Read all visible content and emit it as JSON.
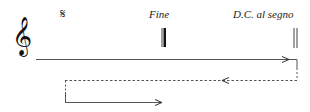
{
  "diagram": {
    "clef": {
      "name": "treble-clef",
      "glyph": "𝄞"
    },
    "segno": {
      "name": "segno",
      "glyph": "𝄋"
    },
    "labels": {
      "fine": "Fine",
      "dc_al_segno": "D.C. al segno"
    },
    "barlines": [
      {
        "name": "final-barline",
        "type": "thin-thick",
        "at": "Fine"
      },
      {
        "name": "double-barline",
        "type": "thin-thin",
        "at": "D.C. al segno"
      }
    ],
    "paths": [
      {
        "step": 1,
        "style": "solid",
        "direction": "right",
        "description": "play from start to D.C. al segno"
      },
      {
        "step": 2,
        "style": "dashed",
        "direction": "left",
        "description": "return back toward the segno"
      },
      {
        "step": 3,
        "style": "solid",
        "direction": "right",
        "description": "play from segno to Fine"
      }
    ],
    "colors": {
      "ink": "#111111",
      "line": "#555555",
      "background": "#ffffff"
    }
  }
}
